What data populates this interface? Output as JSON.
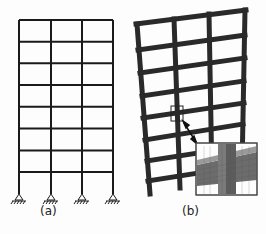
{
  "figure": {
    "panels": [
      {
        "id": "a",
        "label": "(a)",
        "description": "2D frame model, 3 bays x 8 stories, pinned supports"
      },
      {
        "id": "b",
        "label": "(b)",
        "description": "3D finite element model with zoomed mesh detail of beam-column joint"
      }
    ],
    "colors": {
      "line": "#1a1a1a",
      "frame_b": "#2a2a2a",
      "mesh_light": "#8a8a8a",
      "mesh_dark": "#5a5a5a",
      "background": "#fdfdfd"
    }
  }
}
